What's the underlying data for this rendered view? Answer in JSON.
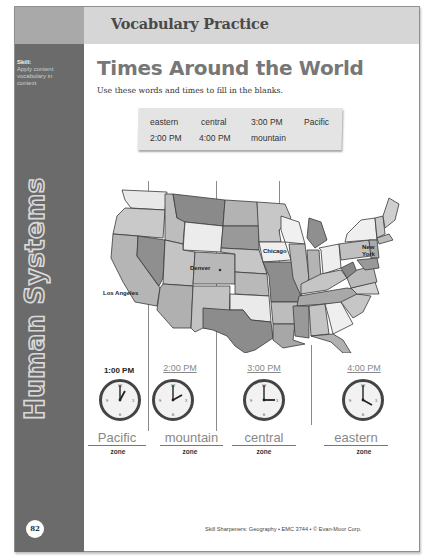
{
  "header": {
    "section_title": "Vocabulary Practice"
  },
  "sidebar": {
    "skill_label": "Skill:",
    "skill_text": "Apply content vocabulary in context",
    "vertical_title": "Human Systems",
    "page_number": "82"
  },
  "main": {
    "title": "Times Around the World",
    "instructions": "Use these words and times to fill in the blanks."
  },
  "word_bank": {
    "words": [
      "eastern",
      "central",
      "3:00 PM",
      "Pacific",
      "2:00 PM",
      "4:00 PM",
      "mountain"
    ]
  },
  "map": {
    "cities": [
      {
        "name": "Los Angeles"
      },
      {
        "name": "Denver"
      },
      {
        "name": "Chicago"
      },
      {
        "name": "New York"
      }
    ]
  },
  "clocks": [
    {
      "time": "1:00 PM",
      "given": true,
      "hour": 1,
      "zone_answer": "Pacific",
      "zone_word": "zone"
    },
    {
      "time": "2:00 PM",
      "given": false,
      "hour": 2,
      "zone_answer": "mountain",
      "zone_word": "zone"
    },
    {
      "time": "3:00 PM",
      "given": false,
      "hour": 3,
      "zone_answer": "central",
      "zone_word": "zone"
    },
    {
      "time": "4:00 PM",
      "given": false,
      "hour": 4,
      "zone_answer": "eastern",
      "zone_word": "zone"
    }
  ],
  "footer": {
    "text": "Skill Sharpeners: Geography • EMC 3744 • © Evan-Moor Corp."
  },
  "colors": {
    "sidebar_dark": "#6b6b6b",
    "sidebar_light": "#a9a9a9",
    "header_bar": "#d6d6d6",
    "title_gray": "#777777",
    "answer_gray": "#888888"
  }
}
